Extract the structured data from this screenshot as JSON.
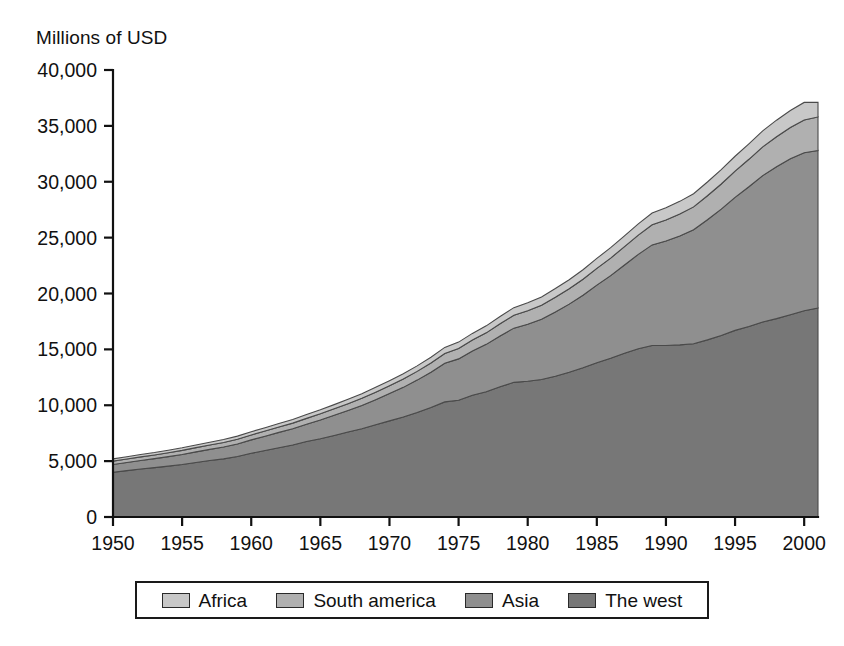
{
  "chart_data": {
    "type": "area",
    "stacked": true,
    "title": "",
    "ylabel": "Millions of USD",
    "xlabel": "",
    "ylim": [
      0,
      40000
    ],
    "xlim": [
      1950,
      2001
    ],
    "grid": false,
    "legend_position": "bottom",
    "ytick_labels": [
      "0",
      "5,000",
      "10,000",
      "15,000",
      "20,000",
      "25,000",
      "30,000",
      "35,000",
      "40,000"
    ],
    "ytick_values": [
      0,
      5000,
      10000,
      15000,
      20000,
      25000,
      30000,
      35000,
      40000
    ],
    "xtick_labels": [
      "1950",
      "1955",
      "1960",
      "1965",
      "1970",
      "1975",
      "1980",
      "1985",
      "1990",
      "1995",
      "2000"
    ],
    "xtick_values": [
      1950,
      1955,
      1960,
      1965,
      1970,
      1975,
      1980,
      1985,
      1990,
      1995,
      2000
    ],
    "x": [
      1950,
      1951,
      1952,
      1953,
      1954,
      1955,
      1956,
      1957,
      1958,
      1959,
      1960,
      1961,
      1962,
      1963,
      1964,
      1965,
      1966,
      1967,
      1968,
      1969,
      1970,
      1971,
      1972,
      1973,
      1974,
      1975,
      1976,
      1977,
      1978,
      1979,
      1980,
      1981,
      1982,
      1983,
      1984,
      1985,
      1986,
      1987,
      1988,
      1989,
      1990,
      1991,
      1992,
      1993,
      1994,
      1995,
      1996,
      1997,
      1998,
      1999,
      2000,
      2001
    ],
    "series": [
      {
        "name": "The west",
        "color": "#777777",
        "values": [
          4000,
          4150,
          4300,
          4420,
          4550,
          4700,
          4880,
          5050,
          5200,
          5420,
          5700,
          5950,
          6200,
          6450,
          6750,
          7000,
          7300,
          7600,
          7900,
          8250,
          8600,
          8950,
          9350,
          9800,
          10300,
          10450,
          10900,
          11200,
          11650,
          12050,
          12150,
          12300,
          12600,
          12950,
          13350,
          13800,
          14200,
          14650,
          15050,
          15350,
          15350,
          15400,
          15500,
          15850,
          16250,
          16700,
          17050,
          17450,
          17750,
          18100,
          18450,
          18700
        ]
      },
      {
        "name": "Asia",
        "color": "#8f8f8f",
        "values": [
          700,
          730,
          760,
          800,
          850,
          900,
          950,
          1000,
          1060,
          1120,
          1200,
          1280,
          1370,
          1450,
          1550,
          1680,
          1800,
          1930,
          2080,
          2250,
          2450,
          2650,
          2900,
          3150,
          3450,
          3700,
          3950,
          4250,
          4550,
          4850,
          5100,
          5400,
          5750,
          6100,
          6500,
          6950,
          7400,
          7900,
          8450,
          9000,
          9350,
          9750,
          10200,
          10750,
          11300,
          11900,
          12500,
          13100,
          13600,
          13950,
          14150,
          14100
        ]
      },
      {
        "name": "South america",
        "color": "#b0b0b0",
        "values": [
          300,
          310,
          320,
          330,
          345,
          360,
          375,
          390,
          405,
          420,
          440,
          460,
          480,
          500,
          525,
          550,
          580,
          610,
          640,
          670,
          700,
          740,
          780,
          830,
          880,
          930,
          980,
          1030,
          1090,
          1150,
          1200,
          1250,
          1310,
          1370,
          1430,
          1500,
          1570,
          1640,
          1720,
          1800,
          1880,
          1960,
          2050,
          2150,
          2250,
          2350,
          2460,
          2570,
          2680,
          2800,
          2920,
          3000
        ]
      },
      {
        "name": "Africa",
        "color": "#c8c8c8",
        "values": [
          200,
          205,
          210,
          215,
          225,
          235,
          245,
          255,
          265,
          275,
          290,
          300,
          315,
          330,
          345,
          360,
          375,
          390,
          410,
          430,
          450,
          470,
          495,
          520,
          545,
          570,
          600,
          625,
          655,
          685,
          715,
          745,
          780,
          815,
          850,
          890,
          930,
          970,
          1010,
          1050,
          1095,
          1135,
          1180,
          1230,
          1280,
          1330,
          1380,
          1430,
          1480,
          1530,
          1580,
          1300
        ]
      }
    ],
    "totals_endpoints": {
      "1950": 5200,
      "2001": 37100
    }
  },
  "legend": {
    "items": [
      {
        "label": "Africa",
        "swatch": "#c8c8c8"
      },
      {
        "label": "South america",
        "swatch": "#b0b0b0"
      },
      {
        "label": "Asia",
        "swatch": "#8f8f8f"
      },
      {
        "label": "The west",
        "swatch": "#777777"
      }
    ]
  }
}
